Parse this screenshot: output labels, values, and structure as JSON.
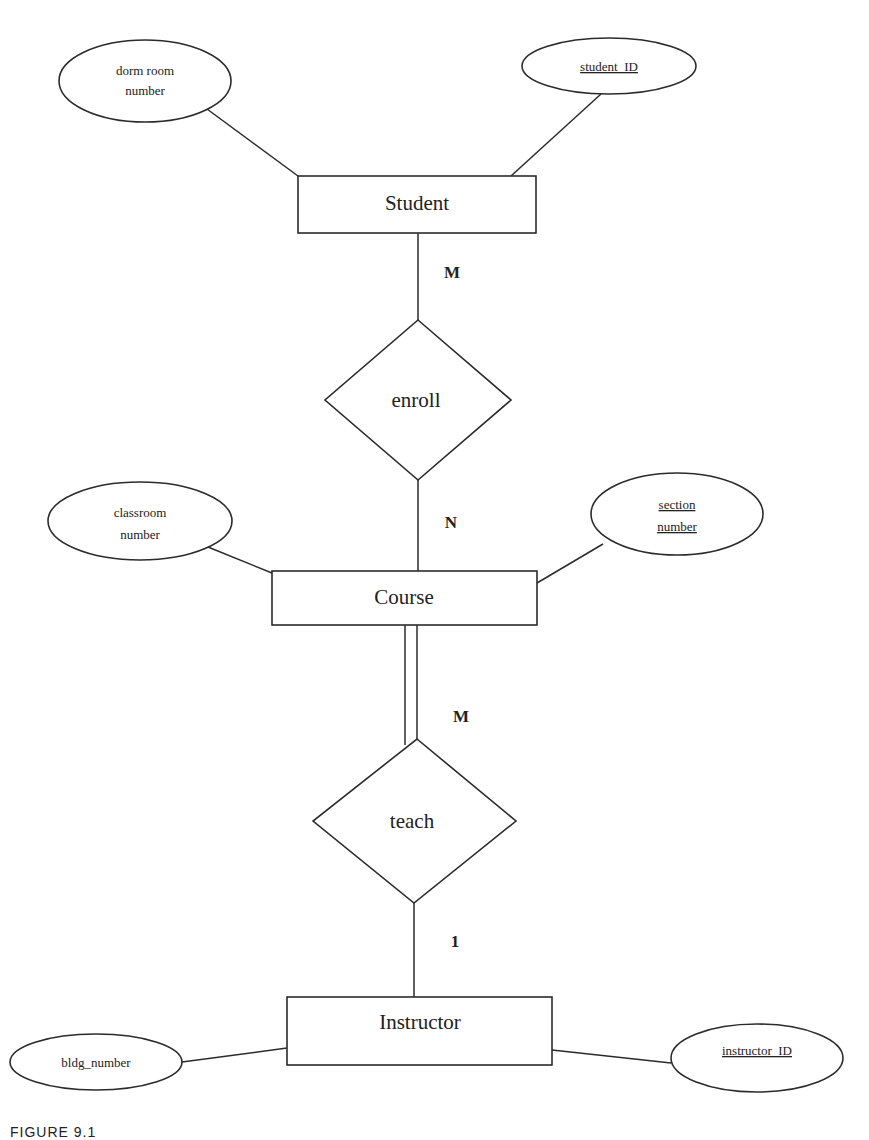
{
  "diagram": {
    "type": "ER diagram",
    "entities": [
      {
        "id": "student",
        "label": "Student",
        "x": 298,
        "y": 176,
        "w": 238,
        "h": 57
      },
      {
        "id": "course",
        "label": "Course",
        "x": 272,
        "y": 571,
        "w": 265,
        "h": 54
      },
      {
        "id": "instructor",
        "label": "Instructor",
        "x": 287,
        "y": 997,
        "w": 265,
        "h": 68
      }
    ],
    "relationships": [
      {
        "id": "enroll",
        "label": "enroll",
        "cx": 418,
        "cy": 400,
        "rx": 93,
        "ry": 80
      },
      {
        "id": "teach",
        "label": "teach",
        "cx": 415,
        "cy": 821,
        "rx": 101,
        "ry": 82
      }
    ],
    "attributes": [
      {
        "id": "dorm_room_number",
        "lines": [
          "dorm room",
          "number"
        ],
        "key": false,
        "cx": 145,
        "cy": 81,
        "rx": 86,
        "ry": 41,
        "entity": "student"
      },
      {
        "id": "student_ID",
        "lines": [
          "student_ID"
        ],
        "key": true,
        "cx": 609,
        "cy": 66,
        "rx": 87,
        "ry": 28,
        "entity": "student"
      },
      {
        "id": "classroom_number",
        "lines": [
          "classroom",
          "number"
        ],
        "key": false,
        "cx": 140,
        "cy": 521,
        "rx": 92,
        "ry": 39,
        "entity": "course"
      },
      {
        "id": "section_number",
        "lines": [
          "section",
          "number"
        ],
        "key": true,
        "cx": 677,
        "cy": 514,
        "rx": 86,
        "ry": 41,
        "entity": "course"
      },
      {
        "id": "bldg_number",
        "lines": [
          "bldg_number"
        ],
        "key": false,
        "cx": 96,
        "cy": 1062,
        "rx": 86,
        "ry": 28,
        "entity": "instructor"
      },
      {
        "id": "instructor_ID",
        "lines": [
          "instructor_ID"
        ],
        "key": true,
        "cx": 757,
        "cy": 1058,
        "rx": 86,
        "ry": 34,
        "entity": "instructor"
      }
    ],
    "cardinalities": [
      {
        "label": "M",
        "x": 452,
        "y": 278,
        "between": "student-enroll"
      },
      {
        "label": "N",
        "x": 451,
        "y": 528,
        "between": "enroll-course"
      },
      {
        "label": "M",
        "x": 452,
        "y": 722,
        "between": "course-teach",
        "participation": "total"
      },
      {
        "label": "1",
        "x": 453,
        "y": 947,
        "between": "teach-instructor"
      }
    ]
  },
  "caption": "FIGURE 9.1"
}
